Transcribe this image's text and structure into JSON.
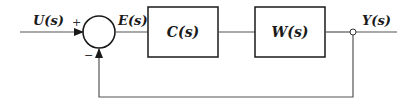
{
  "diagram": {
    "type": "feedback-control-block-diagram",
    "signals": {
      "input": "U(s)",
      "error": "E(s)",
      "output": "Y(s)"
    },
    "summing_junction": {
      "plus_sign": "+",
      "minus_sign": "−"
    },
    "blocks": [
      {
        "id": "controller",
        "label": "C(s)"
      },
      {
        "id": "plant",
        "label": "W(s)"
      }
    ],
    "colors": {
      "stroke": "#1a1a1a",
      "line": "#555555",
      "background": "#ffffff"
    }
  }
}
